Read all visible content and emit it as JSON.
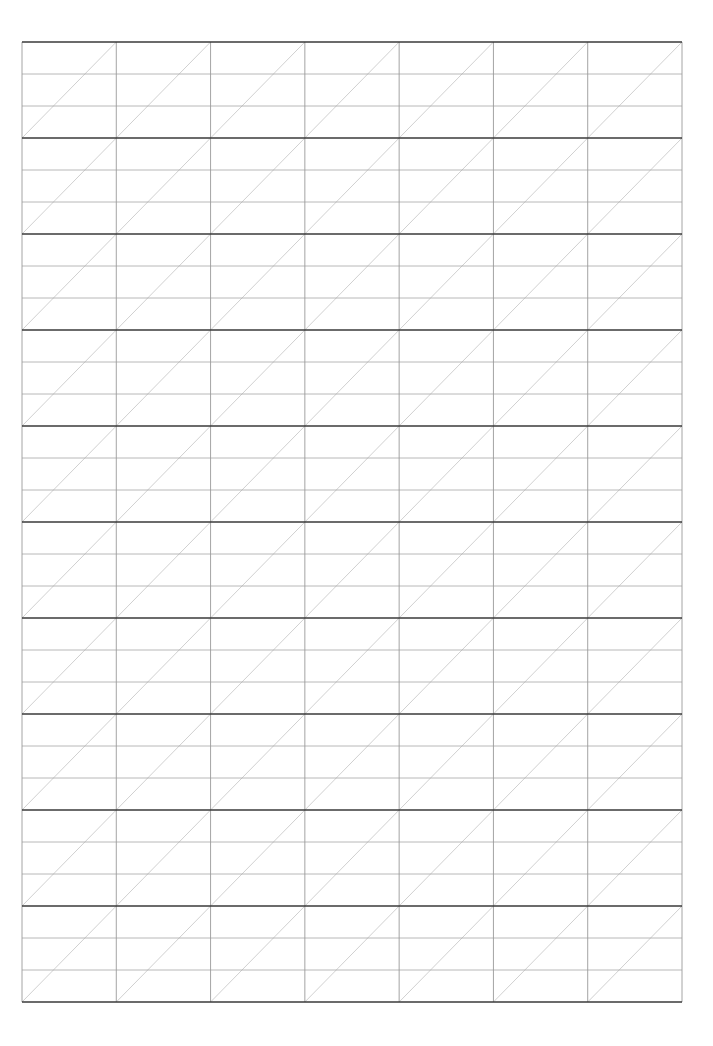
{
  "page": {
    "type": "handwriting-practice-grid",
    "width": 713,
    "height": 1046
  },
  "grid": {
    "left": 22,
    "top": 42,
    "right": 682,
    "bottom": 1002,
    "columns": 7,
    "blocks": 10,
    "rows_per_block": 3,
    "diagonal": "bottom-left-to-top-right"
  },
  "colors": {
    "background": "#ffffff",
    "block_line": "#3a3a3a",
    "row_line": "#a6a6a6",
    "column_line": "#9a9a9a",
    "diagonal_line": "#c4c4c4"
  }
}
